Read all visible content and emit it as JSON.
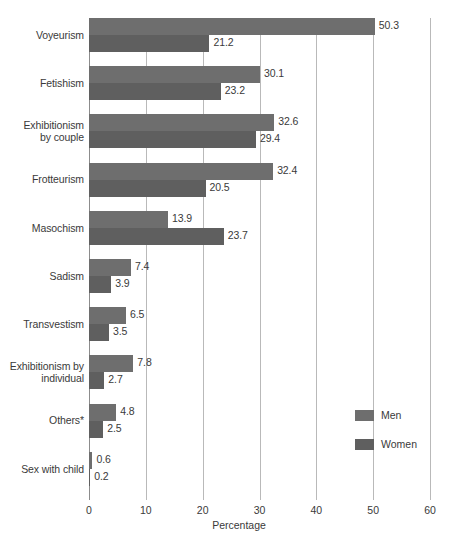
{
  "chart_data": {
    "type": "bar",
    "orientation": "horizontal",
    "title": "",
    "xlabel": "Percentage",
    "ylabel": "",
    "xlim": [
      0,
      60
    ],
    "xticks": [
      0,
      10,
      20,
      30,
      40,
      50,
      60
    ],
    "grid": "vertical",
    "legend_position": "right",
    "categories": [
      "Voyeurism",
      "Fetishism",
      "Exhibitionism by couple",
      "Frotteurism",
      "Masochism",
      "Sadism",
      "Transvestism",
      "Exhibitionism by individual",
      "Others*",
      "Sex with child"
    ],
    "category_lines": [
      [
        "Voyeurism"
      ],
      [
        "Fetishism"
      ],
      [
        "Exhibitionism",
        "by couple"
      ],
      [
        "Frotteurism"
      ],
      [
        "Masochism"
      ],
      [
        "Sadism"
      ],
      [
        "Transvestism"
      ],
      [
        "Exhibitionism by",
        "individual"
      ],
      [
        "Others*"
      ],
      [
        "Sex with child"
      ]
    ],
    "series": [
      {
        "name": "Men",
        "color": "#6e6e6e",
        "values": [
          50.3,
          30.1,
          32.6,
          32.4,
          13.9,
          7.4,
          6.5,
          7.8,
          4.8,
          0.6
        ],
        "labels": [
          "50.3",
          "30.1",
          "32.6",
          "32.4",
          "13.9",
          "7.4",
          "6.5",
          "7.8",
          "4.8",
          "0.6"
        ]
      },
      {
        "name": "Women",
        "color": "#5f5f5f",
        "values": [
          21.2,
          23.2,
          29.4,
          20.5,
          23.7,
          3.9,
          3.5,
          2.7,
          2.5,
          0.2
        ],
        "labels": [
          "21.2",
          "23.2",
          "29.4",
          "20.5",
          "23.7",
          "3.9",
          "3.5",
          "2.7",
          "2.5",
          "0.2"
        ]
      }
    ]
  },
  "legend": {
    "items": [
      {
        "label": "Men",
        "color": "#6e6e6e"
      },
      {
        "label": "Women",
        "color": "#5f5f5f"
      }
    ]
  },
  "axis": {
    "x_title": "Percentage",
    "tick_labels": [
      "0",
      "10",
      "20",
      "30",
      "40",
      "50",
      "60"
    ]
  },
  "colors": {
    "men": "#6e6e6e",
    "women": "#5f5f5f",
    "gridline": "#b9b9b9",
    "axis": "#8c8c8c",
    "text": "#3a3a3a",
    "background": "#ffffff"
  }
}
